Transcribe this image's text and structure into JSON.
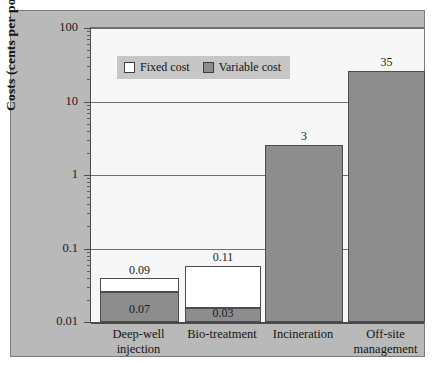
{
  "chart_data": {
    "type": "bar",
    "title": "",
    "xlabel": "",
    "ylabel": "Costs (cents per pound)",
    "scale": "log",
    "ylim": [
      0.01,
      100
    ],
    "yticks": [
      0.01,
      0.1,
      1,
      10,
      100
    ],
    "ytick_labels": [
      "0.01",
      "0.1",
      "1",
      "10",
      "100"
    ],
    "grid": true,
    "legend_position": "top-left",
    "stacked": true,
    "categories": [
      "Deep-well injection",
      "Bio-treatment",
      "Incineration",
      "Off-site management"
    ],
    "category_lines": [
      [
        "Deep-well",
        "injection"
      ],
      [
        "Bio-treatment",
        ""
      ],
      [
        "Incineration",
        ""
      ],
      [
        "Off-site",
        "management"
      ]
    ],
    "series": [
      {
        "name": "Variable cost",
        "color": "#8d8d8d",
        "values": [
          0.07,
          0.03,
          3,
          35
        ],
        "labels": [
          "0.07",
          "0.03",
          "",
          ""
        ]
      },
      {
        "name": "Fixed cost",
        "color": "#ffffff",
        "values": [
          0.02,
          0.08,
          0,
          0
        ],
        "labels": [
          "",
          "",
          "",
          ""
        ]
      }
    ],
    "totals": [
      0.09,
      0.11,
      3,
      35
    ],
    "total_labels": [
      "0.09",
      "0.11",
      "3",
      "35"
    ]
  },
  "legend": {
    "items": [
      {
        "label": "Fixed cost",
        "swatch": "white-square-icon"
      },
      {
        "label": "Variable cost",
        "swatch": "gray-square-icon"
      }
    ]
  }
}
